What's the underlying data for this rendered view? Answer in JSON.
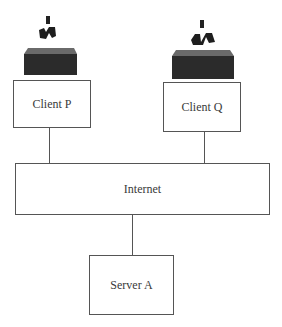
{
  "diagram": {
    "type": "network-topology",
    "nodes": [
      {
        "id": "client_p",
        "label": "Client P",
        "icon": "computer-terminal-icon"
      },
      {
        "id": "client_q",
        "label": "Client Q",
        "icon": "computer-terminal-icon"
      },
      {
        "id": "internet",
        "label": "Internet"
      },
      {
        "id": "server_a",
        "label": "Server A"
      }
    ],
    "edges": [
      {
        "from": "client_p",
        "to": "internet"
      },
      {
        "from": "client_q",
        "to": "internet"
      },
      {
        "from": "internet",
        "to": "server_a"
      }
    ]
  },
  "labels": {
    "client_p": "Client P",
    "client_q": "Client Q",
    "internet": "Internet",
    "server_a": "Server A"
  }
}
